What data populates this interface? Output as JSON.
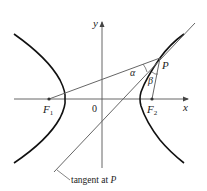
{
  "diagram": {
    "type": "hyperbola-reflection-property",
    "axes": {
      "x_label": "x",
      "y_label": "y",
      "origin_label": "0"
    },
    "points": {
      "focus_left": {
        "label": "F",
        "subscript": "1"
      },
      "focus_right": {
        "label": "F",
        "subscript": "2"
      },
      "point_on_curve": {
        "label": "P"
      }
    },
    "angles": {
      "alpha": "α",
      "beta": "β"
    },
    "annotations": {
      "tangent_label": "tangent at ",
      "tangent_label_point": "P"
    },
    "colors": {
      "curve": "#111111",
      "lines": "#555555",
      "axes": "#444444",
      "text": "#222222"
    }
  }
}
